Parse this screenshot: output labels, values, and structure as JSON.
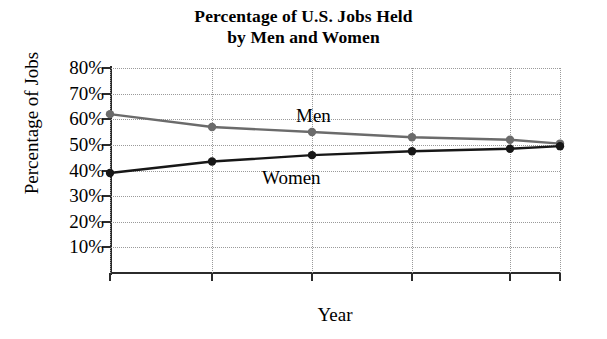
{
  "chart_data": {
    "type": "line",
    "title": "Percentage of U.S. Jobs Held by Men and Women",
    "title_lines": [
      "Percentage of U.S. Jobs Held",
      "by Men and Women"
    ],
    "xlabel": "Year",
    "ylabel": "Percentage of Jobs",
    "x": [
      1970,
      1980,
      1990,
      2000,
      2010,
      2015
    ],
    "categories": [
      "1970",
      "1980",
      "1990",
      "2000",
      "2010",
      "2015"
    ],
    "xlim": [
      1970,
      2015
    ],
    "ylim": [
      0,
      80
    ],
    "ytick_values": [
      80,
      70,
      60,
      50,
      40,
      30,
      20,
      10
    ],
    "ytick_labels": [
      "80%",
      "70%",
      "60%",
      "50%",
      "40%",
      "30%",
      "20%",
      "10%"
    ],
    "grid": "dotted",
    "legend_position": "inline-labels",
    "series": [
      {
        "name": "Men",
        "color": "#6b6b6b",
        "marker": "circle",
        "values": [
          62,
          57,
          55,
          53,
          52,
          50.5
        ]
      },
      {
        "name": "Women",
        "color": "#171717",
        "marker": "circle",
        "values": [
          39,
          43.5,
          46,
          47.5,
          48.5,
          49.5
        ]
      }
    ],
    "annotations": [
      {
        "text": "Men",
        "series": "Men"
      },
      {
        "text": "Women",
        "series": "Women"
      }
    ]
  }
}
